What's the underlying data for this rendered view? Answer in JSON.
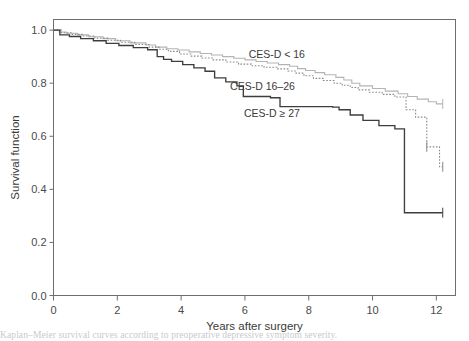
{
  "figure": {
    "background_color": "#ffffff",
    "caption_fragment": "Kaplan–Meier survival curves according to preoperative depressive symptom severity."
  },
  "axes": {
    "x_title": "Years after surgery",
    "y_title": "Survival function",
    "x_ticks": [
      "0",
      "2",
      "4",
      "6",
      "8",
      "10",
      "12"
    ],
    "y_ticks": [
      "0.0",
      "0.2",
      "0.4",
      "0.6",
      "0.8",
      "1.0"
    ]
  },
  "annotations": [
    {
      "name": "label-cesd-low",
      "text": "CES-D < 16",
      "x": 7.0,
      "y": 0.895
    },
    {
      "name": "label-cesd-mid",
      "text": "CES-D 16–26",
      "x": 6.55,
      "y": 0.775
    },
    {
      "name": "label-cesd-high",
      "text": "CES-D ≥ 27",
      "x": 6.85,
      "y": 0.672
    }
  ],
  "chart_data": {
    "type": "line",
    "title": "",
    "subtitle": "",
    "xlabel": "Years after surgery",
    "ylabel": "Survival function",
    "xlim": [
      0,
      12.6
    ],
    "ylim": [
      0.0,
      1.04
    ],
    "xticks": [
      0,
      2,
      4,
      6,
      8,
      10,
      12
    ],
    "yticks": [
      0.0,
      0.2,
      0.4,
      0.6,
      0.8,
      1.0
    ],
    "grid": false,
    "legend": "inline-annotations",
    "colors": {
      "cesd_low": "#b4b4b4",
      "cesd_mid": "#8a8a8a",
      "cesd_high": "#3d3d3d"
    },
    "series": [
      {
        "name": "CES-D < 16",
        "style": "solid-light",
        "color": "#b4b4b4",
        "x": [
          0.0,
          0.18,
          0.4,
          0.75,
          1.1,
          1.55,
          1.95,
          2.4,
          2.9,
          3.2,
          3.55,
          3.9,
          4.25,
          4.6,
          4.95,
          5.3,
          5.65,
          6.0,
          6.35,
          6.7,
          7.05,
          7.4,
          7.65,
          7.9,
          8.2,
          8.5,
          8.85,
          9.1,
          9.35,
          9.6,
          10.0,
          10.4,
          10.8,
          11.1,
          11.4,
          11.75,
          12.0,
          12.2
        ],
        "y": [
          1.0,
          0.993,
          0.988,
          0.982,
          0.975,
          0.968,
          0.96,
          0.952,
          0.944,
          0.936,
          0.93,
          0.925,
          0.918,
          0.912,
          0.906,
          0.9,
          0.894,
          0.888,
          0.882,
          0.876,
          0.87,
          0.864,
          0.855,
          0.848,
          0.84,
          0.832,
          0.822,
          0.812,
          0.8,
          0.79,
          0.78,
          0.77,
          0.76,
          0.75,
          0.74,
          0.73,
          0.722,
          0.722
        ]
      },
      {
        "name": "CES-D 16–26",
        "style": "dotted",
        "color": "#8a8a8a",
        "x": [
          0.0,
          0.25,
          0.55,
          0.9,
          1.3,
          1.7,
          2.1,
          2.55,
          3.0,
          3.3,
          3.6,
          3.95,
          4.3,
          4.65,
          5.0,
          5.4,
          5.8,
          6.2,
          6.6,
          7.0,
          7.35,
          7.6,
          7.85,
          8.15,
          8.45,
          8.8,
          9.05,
          9.3,
          9.55,
          9.9,
          10.3,
          10.7,
          11.05,
          11.35,
          11.7,
          11.95,
          12.1,
          12.2
        ],
        "y": [
          1.0,
          0.99,
          0.984,
          0.978,
          0.97,
          0.962,
          0.954,
          0.946,
          0.936,
          0.928,
          0.92,
          0.91,
          0.902,
          0.895,
          0.888,
          0.88,
          0.872,
          0.866,
          0.86,
          0.854,
          0.846,
          0.838,
          0.828,
          0.818,
          0.81,
          0.8,
          0.792,
          0.784,
          0.775,
          0.766,
          0.758,
          0.748,
          0.7,
          0.672,
          0.56,
          0.56,
          0.485,
          0.485
        ]
      },
      {
        "name": "CES-D ≥ 27",
        "style": "solid-dark",
        "color": "#3d3d3d",
        "x": [
          0.0,
          0.2,
          0.5,
          0.85,
          1.25,
          1.65,
          2.05,
          2.5,
          2.95,
          3.25,
          3.45,
          3.7,
          4.05,
          4.4,
          4.75,
          5.05,
          5.4,
          5.75,
          5.95,
          6.3,
          6.8,
          7.1,
          7.5,
          7.9,
          8.3,
          8.75,
          8.95,
          9.3,
          9.7,
          10.2,
          10.7,
          11.0,
          11.4,
          11.8,
          12.1,
          12.2
        ],
        "y": [
          1.0,
          0.982,
          0.976,
          0.968,
          0.96,
          0.95,
          0.942,
          0.934,
          0.926,
          0.9,
          0.89,
          0.882,
          0.87,
          0.858,
          0.845,
          0.82,
          0.805,
          0.79,
          0.75,
          0.75,
          0.745,
          0.712,
          0.712,
          0.712,
          0.712,
          0.71,
          0.7,
          0.68,
          0.66,
          0.64,
          0.628,
          0.312,
          0.312,
          0.312,
          0.312,
          0.312
        ]
      }
    ]
  }
}
